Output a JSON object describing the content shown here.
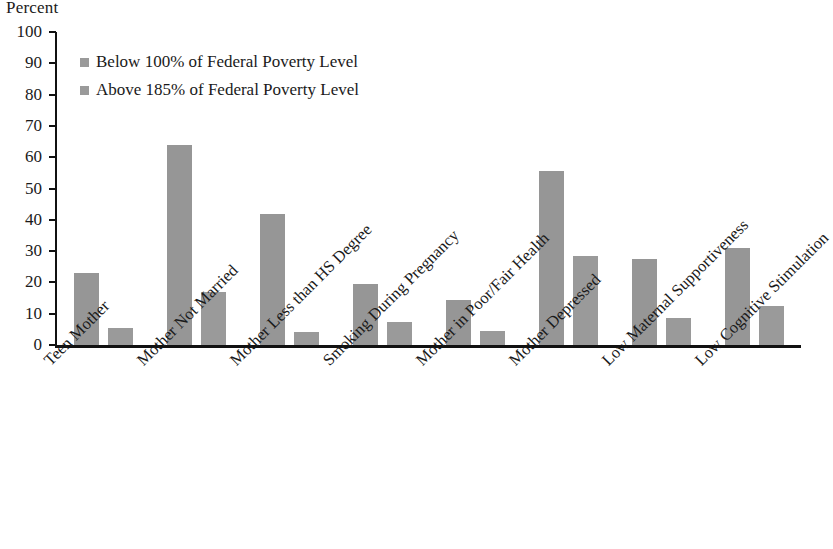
{
  "chart_data": {
    "type": "bar",
    "title": "",
    "xlabel": "",
    "ylabel": "Percent",
    "ylim": [
      0,
      100
    ],
    "yticks": [
      0,
      10,
      20,
      30,
      40,
      50,
      60,
      70,
      80,
      90,
      100
    ],
    "ytick_labels": [
      "0",
      "10",
      "20",
      "30",
      "40",
      "50",
      "60",
      "70",
      "80",
      "90",
      "100"
    ],
    "grid": false,
    "legend_position": "upper-left-inside",
    "categories": [
      "Teen Mother",
      "Mother Not Married",
      "Mother Less than HS Degree",
      "Smoking During Pregnancy",
      "Mother in Poor/Fair Health",
      "Mother Depressed",
      "Low Maternal Supportiveness",
      "Low Cognitive Stimulation"
    ],
    "series": [
      {
        "name": "Below 100% of Federal Poverty Level",
        "color": "#969696",
        "values": [
          23,
          64,
          42,
          19.5,
          14.5,
          55.5,
          27.5,
          31
        ]
      },
      {
        "name": "Above 185% of Federal Poverty Level",
        "color": "#9a9a9a",
        "values": [
          5.5,
          17,
          4,
          7.5,
          4.5,
          28.5,
          8.5,
          12.5
        ]
      }
    ]
  },
  "legend": {
    "items": [
      {
        "label": "Below 100% of Federal Poverty Level"
      },
      {
        "label": "Above 185% of Federal Poverty Level"
      }
    ]
  },
  "axis": {
    "y_title": "Percent"
  },
  "title_remnant": "",
  "colors": {
    "bar": "#969696",
    "axis": "#111111",
    "text": "#1a1a1a"
  }
}
